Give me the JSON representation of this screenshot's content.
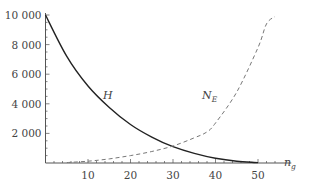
{
  "chart_data": {
    "type": "line",
    "title": "",
    "xlabel": "n_g",
    "ylabel": "",
    "xlim": [
      0,
      55
    ],
    "ylim": [
      0,
      10000
    ],
    "grid": false,
    "legend": "inline curve labels",
    "x_ticks": [
      10,
      20,
      30,
      40,
      50
    ],
    "x_tick_labels": [
      "10",
      "20",
      "30",
      "40",
      "50"
    ],
    "y_ticks": [
      2000,
      4000,
      6000,
      8000,
      10000
    ],
    "y_tick_labels": [
      "2 000",
      "4 000",
      "6 000",
      "8 000",
      "10 000"
    ],
    "series": [
      {
        "name": "H",
        "style": "solid",
        "color": "#222222",
        "x": [
          0,
          5,
          10,
          15,
          20,
          25,
          30,
          35,
          40,
          45,
          50
        ],
        "values": [
          10000,
          7200,
          5200,
          3750,
          2600,
          1750,
          1100,
          650,
          320,
          120,
          30
        ]
      },
      {
        "name": "N_E",
        "style": "dashed",
        "color": "#666666",
        "x": [
          5,
          10,
          15,
          20,
          25,
          30,
          35,
          38,
          40,
          45,
          50,
          52,
          54
        ],
        "values": [
          30,
          120,
          280,
          500,
          780,
          1150,
          1700,
          2100,
          2700,
          4800,
          7800,
          9400,
          9900
        ]
      }
    ],
    "annotations": [
      {
        "text": "H",
        "x": 14,
        "y": 4200
      },
      {
        "text": "N_E",
        "x": 37,
        "y": 4200
      }
    ]
  },
  "labels": {
    "x_axis": {
      "main": "n",
      "sub": "g"
    },
    "curve_h": "H",
    "curve_ne": {
      "main": "N",
      "sub": "E"
    }
  }
}
